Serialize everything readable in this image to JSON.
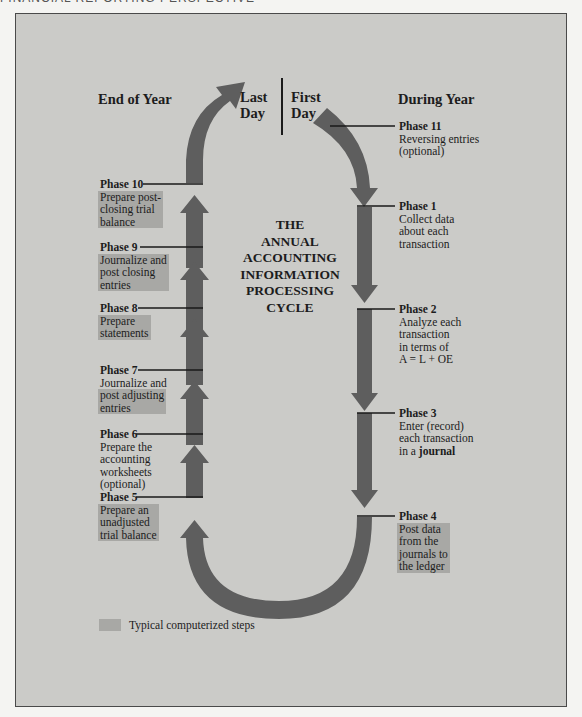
{
  "page_header": "FINANCIAL REPORTING PERSPECTIVE",
  "diagram": {
    "title_lines": [
      "THE",
      "ANNUAL",
      "ACCOUNTING",
      "INFORMATION",
      "PROCESSING",
      "CYCLE"
    ],
    "headings": {
      "end_of_year": "End of Year",
      "during_year": "During Year",
      "last_day_1": "Last",
      "last_day_2": "Day",
      "first_day_1": "First",
      "first_day_2": "Day"
    },
    "phases": {
      "p1": {
        "title": "Phase 1",
        "lines": [
          "Collect data",
          "about each",
          "transaction"
        ],
        "computerized": false
      },
      "p2": {
        "title": "Phase 2",
        "lines": [
          "Analyze each",
          "transaction",
          "in terms of",
          "A = L + OE"
        ],
        "computerized": false
      },
      "p3": {
        "title": "Phase 3",
        "lines": [
          "Enter (record)",
          "each transaction",
          "in a"
        ],
        "bold_term": "journal",
        "computerized": false
      },
      "p4": {
        "title": "Phase 4",
        "lines": [
          "Post data",
          "from the",
          "journals to",
          "the ledger"
        ],
        "computerized": true
      },
      "p5": {
        "title": "Phase 5",
        "lines": [
          "Prepare an",
          "unadjusted",
          "trial balance"
        ],
        "computerized": true
      },
      "p6": {
        "title": "Phase 6",
        "lines": [
          "Prepare the",
          "accounting",
          "worksheets",
          "(optional)"
        ],
        "computerized": false
      },
      "p7": {
        "title": "Phase 7",
        "lines": [
          "Journalize and",
          "post adjusting",
          "entries"
        ],
        "computerized": "partial"
      },
      "p8": {
        "title": "Phase 8",
        "lines": [
          "Prepare",
          "statements"
        ],
        "computerized": true
      },
      "p9": {
        "title": "Phase 9",
        "lines": [
          "Journalize and",
          "post closing",
          "entries"
        ],
        "computerized": true
      },
      "p10": {
        "title": "Phase 10",
        "lines": [
          "Prepare post-",
          "closing trial",
          "balance"
        ],
        "computerized": true
      },
      "p11": {
        "title": "Phase 11",
        "lines": [
          "Reversing entries",
          "(optional)"
        ],
        "computerized": false
      }
    },
    "legend": {
      "label": "Typical computerized steps",
      "swatch_color": "#a8a8a5"
    },
    "colors": {
      "arrow": "#5e5e5e",
      "background": "#cbcbc8",
      "highlight": "#a8a8a5"
    }
  }
}
